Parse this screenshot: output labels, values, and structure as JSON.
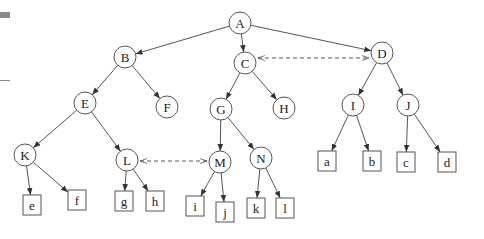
{
  "diagram": {
    "type": "tree",
    "colors": {
      "stroke": "#555555",
      "text": "#222222",
      "background": "#ffffff"
    },
    "internal_nodes": [
      {
        "id": "A",
        "label": "A",
        "x": 240,
        "y": 23
      },
      {
        "id": "B",
        "label": "B",
        "x": 125,
        "y": 57
      },
      {
        "id": "C",
        "label": "C",
        "x": 245,
        "y": 63
      },
      {
        "id": "D",
        "label": "D",
        "x": 382,
        "y": 53
      },
      {
        "id": "E",
        "label": "E",
        "x": 85,
        "y": 103
      },
      {
        "id": "F",
        "label": "F",
        "x": 167,
        "y": 107
      },
      {
        "id": "G",
        "label": "G",
        "x": 221,
        "y": 109
      },
      {
        "id": "H",
        "label": "H",
        "x": 284,
        "y": 108
      },
      {
        "id": "I",
        "label": "I",
        "x": 353,
        "y": 105
      },
      {
        "id": "J",
        "label": "J",
        "x": 408,
        "y": 105
      },
      {
        "id": "K",
        "label": "K",
        "x": 25,
        "y": 155
      },
      {
        "id": "L",
        "label": "L",
        "x": 127,
        "y": 160
      },
      {
        "id": "M",
        "label": "M",
        "x": 220,
        "y": 162
      },
      {
        "id": "N",
        "label": "N",
        "x": 261,
        "y": 158
      }
    ],
    "leaf_nodes": [
      {
        "id": "e",
        "label": "e",
        "x": 32,
        "y": 205
      },
      {
        "id": "f",
        "label": "f",
        "x": 77,
        "y": 200
      },
      {
        "id": "g",
        "label": "g",
        "x": 124,
        "y": 201
      },
      {
        "id": "h",
        "label": "h",
        "x": 155,
        "y": 201
      },
      {
        "id": "i",
        "label": "i",
        "x": 195,
        "y": 206
      },
      {
        "id": "j",
        "label": "j",
        "x": 225,
        "y": 212
      },
      {
        "id": "k",
        "label": "k",
        "x": 256,
        "y": 208
      },
      {
        "id": "l",
        "label": "l",
        "x": 285,
        "y": 208
      },
      {
        "id": "a",
        "label": "a",
        "x": 327,
        "y": 161
      },
      {
        "id": "b",
        "label": "b",
        "x": 372,
        "y": 161
      },
      {
        "id": "c",
        "label": "c",
        "x": 406,
        "y": 162
      },
      {
        "id": "d",
        "label": "d",
        "x": 447,
        "y": 162
      }
    ],
    "edges": [
      [
        "A",
        "B"
      ],
      [
        "A",
        "C"
      ],
      [
        "A",
        "D"
      ],
      [
        "B",
        "E"
      ],
      [
        "B",
        "F"
      ],
      [
        "C",
        "G"
      ],
      [
        "C",
        "H"
      ],
      [
        "D",
        "I"
      ],
      [
        "D",
        "J"
      ],
      [
        "E",
        "K"
      ],
      [
        "E",
        "L"
      ],
      [
        "G",
        "M"
      ],
      [
        "G",
        "N"
      ],
      [
        "I",
        "a"
      ],
      [
        "I",
        "b"
      ],
      [
        "J",
        "c"
      ],
      [
        "J",
        "d"
      ],
      [
        "K",
        "e"
      ],
      [
        "K",
        "f"
      ],
      [
        "L",
        "g"
      ],
      [
        "L",
        "h"
      ],
      [
        "M",
        "i"
      ],
      [
        "M",
        "j"
      ],
      [
        "N",
        "k"
      ],
      [
        "N",
        "l"
      ]
    ],
    "dashed_links": [
      [
        "C",
        "D"
      ],
      [
        "L",
        "M"
      ]
    ]
  }
}
